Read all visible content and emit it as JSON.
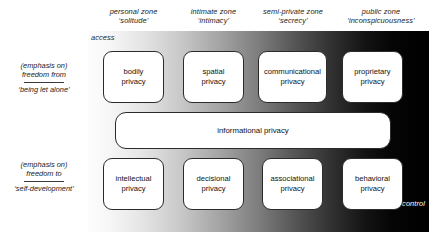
{
  "diagram": {
    "axis": {
      "access_label": "access",
      "control_label": "control"
    },
    "columns": [
      {
        "zone": "personal zone",
        "quoted": "‘solitude’"
      },
      {
        "zone": "intimate zone",
        "quoted": "‘intimacy’"
      },
      {
        "zone": "semi-private zone",
        "quoted": "‘secrecy’"
      },
      {
        "zone": "public zone",
        "quoted": "‘inconspicuousness’"
      }
    ],
    "rows": [
      {
        "emphasis": "(emphasis on)",
        "freedom": "freedom from",
        "quoted": "‘being let alone’"
      },
      {
        "emphasis": "(emphasis on)",
        "freedom": "freedom to",
        "quoted": "‘self-development’"
      }
    ],
    "top_boxes": [
      {
        "line1": "bodily",
        "line2": "privacy"
      },
      {
        "line1": "spatial",
        "line2": "privacy"
      },
      {
        "line1": "communicational",
        "line2": "privacy"
      },
      {
        "line1": "proprietary",
        "line2": "privacy"
      }
    ],
    "bottom_boxes": [
      {
        "line1": "intellectual",
        "line2": "privacy"
      },
      {
        "line1": "decisional",
        "line2": "privacy"
      },
      {
        "line1": "associational",
        "line2": "privacy"
      },
      {
        "line1": "behavioral",
        "line2": "privacy"
      }
    ],
    "center_bar": {
      "label": "informational privacy"
    },
    "colors": {
      "gradient_start": "#ffffff",
      "gradient_end": "#000000",
      "box_fill": "#ffffff",
      "box_stroke": "#2b2b2b",
      "text": "#111111",
      "control_text": "#ffffff"
    }
  }
}
